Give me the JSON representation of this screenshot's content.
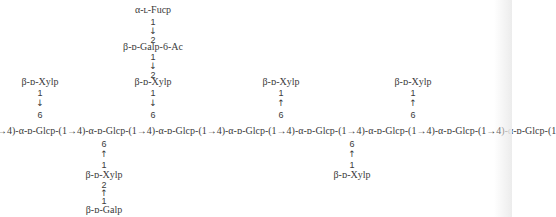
{
  "main_chain": "→4)-α-ᴅ-Glcp-(1→4)-α-ᴅ-Glcp-(1→4)-α-ᴅ-Glcp-(1→4)-α-ᴅ-Glcp-(1→4)-α-ᴅ-Glcp-(1→4)-α-ᴅ-Glcp-(1→4)-α-ᴅ-Glcp-(1→4)-α-ᴅ-Glcp-(1",
  "branches": {
    "left_top": {
      "residue": "β-ᴅ-Xylp",
      "from": "1",
      "arrow": "↓",
      "to": "6"
    },
    "center_top": {
      "fuc": "α-ʟ-Fucp",
      "fuc_from": "1",
      "fuc_arrow": "↓",
      "gal_to": "2",
      "gal": "β-ᴅ-Galp-6-Ac",
      "gal_from": "1",
      "gal_arrow": "↓",
      "xyl_to": "2",
      "xyl": "β-ᴅ-Xylp",
      "xyl_from": "1",
      "xyl_arrow": "↓",
      "glc_to": "6"
    },
    "lower_left": {
      "glc_to": "6",
      "arrow1": "↑",
      "xyl_from": "1",
      "xyl": "β-ᴅ-Xylp",
      "xyl_to": "2",
      "arrow2": "↑",
      "gal_from": "1",
      "gal": "β-ᴅ-Galp"
    },
    "right_top_1": {
      "residue": "β-ᴅ-Xylp",
      "from": "1",
      "arrow": "↑",
      "to": "6"
    },
    "right_top_2": {
      "residue": "β-ᴅ-Xylp",
      "from": "1",
      "arrow": "↑",
      "to": "6"
    },
    "lower_right": {
      "glc_to": "6",
      "arrow": "↑",
      "xyl_from": "1",
      "xyl": "β-ᴅ-Xylp"
    }
  }
}
